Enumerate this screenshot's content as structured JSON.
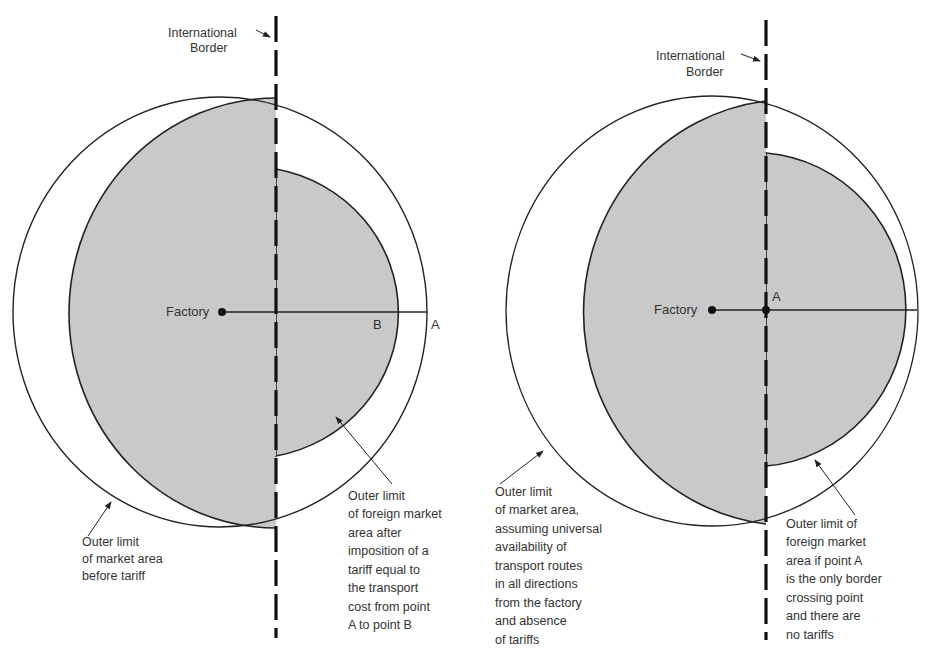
{
  "colors": {
    "shade": "#c9c9c9",
    "line": "#222222",
    "background": "#ffffff",
    "text": "#333333"
  },
  "left_diagram": {
    "border_label": [
      "International",
      "Border"
    ],
    "factory_label": "Factory",
    "point_b_label": "B",
    "point_a_label": "A",
    "annotation_market_area": [
      "Outer limit",
      "of market area",
      "before tariff"
    ],
    "annotation_foreign_area": [
      "Outer limit",
      "of foreign market",
      "area after",
      "imposition of a",
      "tariff equal to",
      "the transport",
      "cost from point",
      "A to point B"
    ]
  },
  "right_diagram": {
    "border_label": [
      "International",
      "Border"
    ],
    "factory_label": "Factory",
    "point_a_label": "A",
    "annotation_market_area": [
      "Outer limit",
      "of market area,",
      "assuming universal",
      "availability of",
      "transport routes",
      "in all directions",
      "from the factory",
      "and absence",
      "of tariffs"
    ],
    "annotation_foreign_area": [
      "Outer limit of",
      "foreign market",
      "area if point A",
      "is the only border",
      "crossing point",
      "and there are",
      "no tariffs"
    ]
  }
}
